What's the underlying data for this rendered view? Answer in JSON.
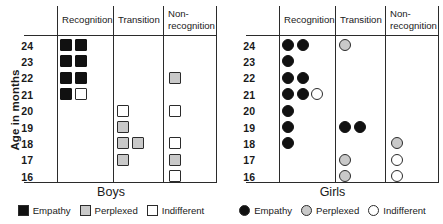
{
  "figure": {
    "y_axis_title": "Age in months",
    "y_ticks": [
      "24",
      "23",
      "22",
      "21",
      "20",
      "19",
      "18",
      "17",
      "16"
    ],
    "column_headers": [
      "Recognition",
      "Transition",
      "Non-recognition"
    ],
    "legend": [
      {
        "label": "Empathy",
        "marker": "filled-black",
        "color": "#111111"
      },
      {
        "label": "Perplexed",
        "marker": "filled-gray",
        "color": "#c9c9c9"
      },
      {
        "label": "Indifferent",
        "marker": "open-white",
        "color": "#ffffff"
      }
    ]
  },
  "chart_data": {
    "type": "scatter",
    "title": "",
    "xlabel": "",
    "ylabel": "Age in months",
    "grid": false,
    "legend_position": "bottom",
    "y_categories": [
      24,
      23,
      22,
      21,
      20,
      19,
      18,
      17,
      16
    ],
    "x_categories": [
      "Recognition",
      "Transition",
      "Non-recognition"
    ],
    "categories_marker_map": {
      "Empathy": "filled-black",
      "Perplexed": "filled-gray",
      "Indifferent": "open-white"
    },
    "panels": [
      {
        "name": "Boys",
        "marker_shape": "square",
        "points": [
          {
            "column": "Recognition",
            "age": 24,
            "type": "Empathy",
            "count": 2
          },
          {
            "column": "Recognition",
            "age": 23,
            "type": "Empathy",
            "count": 2
          },
          {
            "column": "Recognition",
            "age": 22,
            "type": "Empathy",
            "count": 2
          },
          {
            "column": "Recognition",
            "age": 21,
            "type": "Empathy",
            "count": 1
          },
          {
            "column": "Recognition",
            "age": 21,
            "type": "Indifferent",
            "count": 1
          },
          {
            "column": "Transition",
            "age": 20,
            "type": "Indifferent",
            "count": 1
          },
          {
            "column": "Transition",
            "age": 19,
            "type": "Perplexed",
            "count": 1
          },
          {
            "column": "Transition",
            "age": 18,
            "type": "Perplexed",
            "count": 2
          },
          {
            "column": "Transition",
            "age": 17,
            "type": "Perplexed",
            "count": 1
          },
          {
            "column": "Non-recognition",
            "age": 22,
            "type": "Perplexed",
            "count": 1
          },
          {
            "column": "Non-recognition",
            "age": 20,
            "type": "Indifferent",
            "count": 1
          },
          {
            "column": "Non-recognition",
            "age": 18,
            "type": "Indifferent",
            "count": 1
          },
          {
            "column": "Non-recognition",
            "age": 17,
            "type": "Perplexed",
            "count": 1
          },
          {
            "column": "Non-recognition",
            "age": 16,
            "type": "Indifferent",
            "count": 1
          }
        ]
      },
      {
        "name": "Girls",
        "marker_shape": "circle",
        "points": [
          {
            "column": "Recognition",
            "age": 24,
            "type": "Empathy",
            "count": 2
          },
          {
            "column": "Recognition",
            "age": 23,
            "type": "Empathy",
            "count": 1
          },
          {
            "column": "Recognition",
            "age": 22,
            "type": "Empathy",
            "count": 2
          },
          {
            "column": "Recognition",
            "age": 21,
            "type": "Empathy",
            "count": 2
          },
          {
            "column": "Recognition",
            "age": 21,
            "type": "Indifferent",
            "count": 1
          },
          {
            "column": "Recognition",
            "age": 20,
            "type": "Empathy",
            "count": 1
          },
          {
            "column": "Recognition",
            "age": 19,
            "type": "Empathy",
            "count": 1
          },
          {
            "column": "Recognition",
            "age": 18,
            "type": "Empathy",
            "count": 1
          },
          {
            "column": "Transition",
            "age": 24,
            "type": "Perplexed",
            "count": 1
          },
          {
            "column": "Transition",
            "age": 19,
            "type": "Empathy",
            "count": 2
          },
          {
            "column": "Transition",
            "age": 17,
            "type": "Perplexed",
            "count": 1
          },
          {
            "column": "Transition",
            "age": 16,
            "type": "Perplexed",
            "count": 1
          },
          {
            "column": "Non-recognition",
            "age": 18,
            "type": "Perplexed",
            "count": 1
          },
          {
            "column": "Non-recognition",
            "age": 17,
            "type": "Indifferent",
            "count": 1
          },
          {
            "column": "Non-recognition",
            "age": 16,
            "type": "Indifferent",
            "count": 1
          }
        ]
      }
    ]
  }
}
